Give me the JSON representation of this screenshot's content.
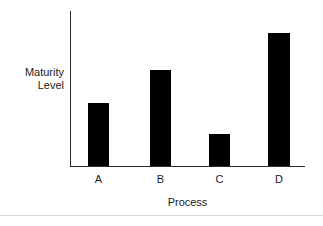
{
  "chart_data": {
    "type": "bar",
    "title": "",
    "subtitle": "",
    "xlabel": "Process",
    "ylabel_line1": "Maturity",
    "ylabel_line2": "Level",
    "ylabel": "Maturity Level",
    "categories": [
      "A",
      "B",
      "C",
      "D"
    ],
    "values": [
      40.6,
      61.9,
      20.6,
      85.8
    ],
    "ylim": [
      0,
      100
    ],
    "grid": false,
    "legend": false,
    "legend_position": "none",
    "bar_color": "#000000",
    "axis_color": "#2b2b2b",
    "background_color": "#ffffff",
    "annotations": [],
    "y_tick_labels": []
  },
  "figure": {
    "bottom_rule_color": "#d9d9d9"
  }
}
